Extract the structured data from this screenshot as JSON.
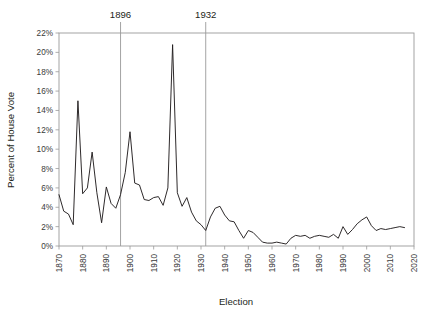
{
  "chart_data": {
    "type": "line",
    "title": "",
    "xlabel": "Election",
    "ylabel": "Percent of House Vote",
    "xlim": [
      1870,
      2020
    ],
    "ylim": [
      0,
      22
    ],
    "grid": false,
    "legend": "none",
    "y_tick_labels": [
      "0%",
      "2%",
      "4%",
      "6%",
      "8%",
      "10%",
      "12%",
      "14%",
      "16%",
      "18%",
      "20%",
      "22%"
    ],
    "y_tick_values": [
      0,
      2,
      4,
      6,
      8,
      10,
      12,
      14,
      16,
      18,
      20,
      22
    ],
    "x_tick_labels": [
      "1870",
      "1880",
      "1890",
      "1900",
      "1910",
      "1920",
      "1930",
      "1940",
      "1950",
      "1960",
      "1970",
      "1980",
      "1990",
      "2000",
      "2010",
      "2020"
    ],
    "x_tick_values": [
      1870,
      1880,
      1890,
      1900,
      1910,
      1920,
      1930,
      1940,
      1950,
      1960,
      1970,
      1980,
      1990,
      2000,
      2010,
      2020
    ],
    "annotations": [
      {
        "label": "1896",
        "x": 1896,
        "type": "vertical-line"
      },
      {
        "label": "1932",
        "x": 1932,
        "type": "vertical-line"
      }
    ],
    "series": [
      {
        "name": "Third-party percent of House vote",
        "color": "#231f20",
        "x": [
          1870,
          1872,
          1874,
          1876,
          1878,
          1880,
          1882,
          1884,
          1886,
          1888,
          1890,
          1892,
          1894,
          1896,
          1898,
          1900,
          1902,
          1904,
          1906,
          1908,
          1910,
          1912,
          1914,
          1916,
          1918,
          1920,
          1922,
          1924,
          1926,
          1928,
          1930,
          1932,
          1934,
          1936,
          1938,
          1940,
          1942,
          1944,
          1946,
          1948,
          1950,
          1952,
          1954,
          1956,
          1958,
          1960,
          1962,
          1964,
          1966,
          1968,
          1970,
          1972,
          1974,
          1976,
          1978,
          1980,
          1982,
          1984,
          1986,
          1988,
          1990,
          1992,
          1994,
          1996,
          1998,
          2000,
          2002,
          2004,
          2006,
          2008,
          2010,
          2012,
          2014,
          2016
        ],
        "values": [
          5.3,
          3.6,
          3.3,
          2.2,
          15.0,
          5.4,
          6.0,
          9.7,
          5.5,
          2.4,
          6.1,
          4.4,
          3.9,
          5.3,
          7.6,
          11.8,
          6.5,
          6.3,
          4.8,
          4.7,
          5.0,
          5.1,
          4.2,
          6.0,
          20.8,
          5.5,
          4.1,
          5.0,
          3.5,
          2.6,
          2.2,
          1.6,
          3.0,
          3.9,
          4.1,
          3.2,
          2.6,
          2.5,
          1.6,
          0.8,
          1.6,
          1.4,
          0.9,
          0.4,
          0.3,
          0.3,
          0.4,
          0.3,
          0.2,
          0.8,
          1.1,
          1.0,
          1.1,
          0.8,
          1.0,
          1.1,
          1.0,
          0.9,
          1.2,
          0.8,
          2.0,
          1.2,
          1.7,
          2.3,
          2.7,
          3.0,
          2.1,
          1.6,
          1.8,
          1.7,
          1.8,
          1.9,
          2.0,
          1.9
        ]
      }
    ]
  },
  "axis": {
    "x_title": "Election",
    "y_title": "Percent of House Vote"
  },
  "colors": {
    "line": "#231f20",
    "frame": "#9a9a9a",
    "annotation_line": "#9a9a9a",
    "tick_label": "#3a3a3a",
    "background": "#ffffff"
  }
}
